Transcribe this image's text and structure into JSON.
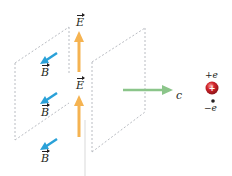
{
  "diagram": {
    "labels": {
      "e_top": "E",
      "e_mid": "E",
      "b_top": "B",
      "b_mid": "B",
      "b_bot": "B",
      "wave_speed": "c",
      "positive_charge": "+e",
      "negative_charge": "−e"
    },
    "colors": {
      "e_field": "#f5b351",
      "b_field": "#2aa1d8",
      "propagation": "#8bc58a",
      "plane_edge": "#b9bcc2",
      "positive_charge": "#d2232a",
      "negative_charge": "#231f20",
      "text": "#231f20"
    },
    "elements": {
      "planes": 2,
      "e_arrows": 2,
      "b_arrows": 3,
      "charges": [
        "+e",
        "−e"
      ]
    }
  }
}
